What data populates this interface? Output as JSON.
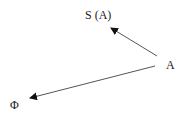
{
  "nodes": {
    "sa": {
      "label": "S (A)"
    },
    "a": {
      "label": "A"
    },
    "phi": {
      "label": "Φ"
    }
  },
  "edges": [
    {
      "from": "A",
      "to": "S (A)"
    },
    {
      "from": "A",
      "to": "Φ"
    }
  ],
  "colors": {
    "line": "#555555",
    "text": "#1a1a1a"
  }
}
